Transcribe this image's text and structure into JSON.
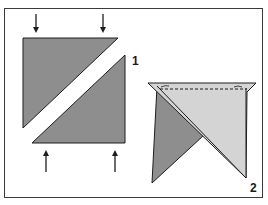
{
  "diagram": {
    "colors": {
      "dark_fabric": "#8e8e8e",
      "light_fabric": "#d4d4d4",
      "outline": "#1e1e1e",
      "frame": "#3a3a3a",
      "background": "#ffffff"
    },
    "figures": [
      {
        "label": "1",
        "description": "Two dark triangles pushed together along the diagonal",
        "arrows": [
          {
            "direction": "down",
            "x": 36
          },
          {
            "direction": "down",
            "x": 103
          },
          {
            "direction": "up",
            "x": 46
          },
          {
            "direction": "up",
            "x": 115
          }
        ]
      },
      {
        "label": "2",
        "description": "Dark and light triangles overlapped with dashed stitching line along the top edge"
      }
    ]
  }
}
